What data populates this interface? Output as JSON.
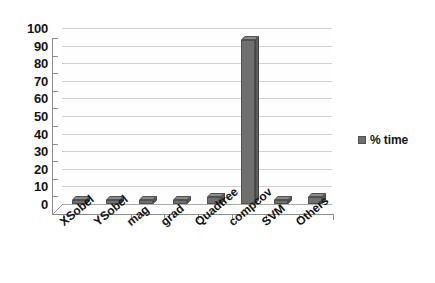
{
  "chart_data": {
    "type": "bar",
    "title": "",
    "subtitle": "",
    "xlabel": "",
    "ylabel": "",
    "categories": [
      "XSobel",
      "YSobel",
      "mag",
      "grad",
      "Quadtree",
      "compcov",
      "SVM",
      "Others"
    ],
    "series": [
      {
        "name": "% time",
        "values": [
          2,
          2,
          2,
          2,
          4,
          93,
          2,
          4
        ],
        "color": "#6f6f6f"
      }
    ],
    "ylim": [
      0,
      100
    ],
    "ytick_labels": [
      "100",
      "90",
      "80",
      "70",
      "60",
      "50",
      "40",
      "30",
      "20",
      "10",
      "0"
    ],
    "ytick_values": [
      100,
      90,
      80,
      70,
      60,
      50,
      40,
      30,
      20,
      10,
      0
    ],
    "ytick_step": 10,
    "grid": true,
    "grid_axis": "y",
    "legend": {
      "position": "right",
      "entries": [
        {
          "label": "% time",
          "color": "#6f6f6f",
          "marker": "square"
        }
      ]
    },
    "style": {
      "three_d": true,
      "background": "#ffffff",
      "grid_color": "#c9c9c9",
      "axis_color": "#8d8d8d",
      "text_color": "#141414",
      "xtick_label_rotation": -40
    }
  }
}
